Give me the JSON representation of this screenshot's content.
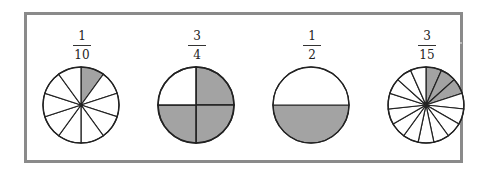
{
  "diagram": {
    "colors": {
      "shaded": "#a3a3a3",
      "unshaded": "#ffffff",
      "stroke": "#222222",
      "frame": "#8a8a8a"
    },
    "items": [
      {
        "numerator": "1",
        "denominator": "10",
        "slices": 10,
        "shaded": 1
      },
      {
        "numerator": "3",
        "denominator": "4",
        "slices": 4,
        "shaded": 3
      },
      {
        "numerator": "1",
        "denominator": "2",
        "slices": 2,
        "shaded": 1
      },
      {
        "numerator": "3",
        "denominator": "15",
        "slices": 15,
        "shaded": 3
      }
    ]
  }
}
